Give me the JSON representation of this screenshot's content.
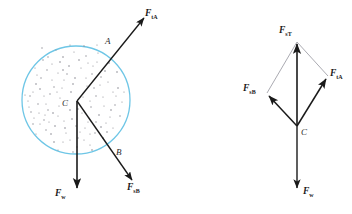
{
  "figure": {
    "colors": {
      "circle_stroke": "#6ec6e6",
      "arrow": "#1a1a1a",
      "thin_line": "#7b7b86",
      "speckle": "#8a8a92",
      "background": "#ffffff",
      "label_text": "#1a1a1a"
    },
    "left_diagram": {
      "name": "ball-free-body-diagram",
      "circle": {
        "cx": 76,
        "cy": 100,
        "r": 54
      },
      "center_point_label": "C",
      "contact_point_a_label": "A",
      "contact_point_b_label": "B",
      "forces": [
        {
          "id": "FtA",
          "symbol": "F",
          "subscript": "tA",
          "description": "contact force at point A directed up and to the right",
          "from": {
            "x": 77,
            "y": 101
          },
          "to": {
            "x": 146,
            "y": 16
          }
        },
        {
          "id": "FsB",
          "symbol": "F",
          "subscript": "sB",
          "description": "contact force at point B directed down and to the right",
          "from": {
            "x": 77,
            "y": 101
          },
          "to": {
            "x": 134,
            "y": 182
          }
        },
        {
          "id": "Fw",
          "symbol": "F",
          "subscript": "w",
          "description": "weight force directed straight down from the center",
          "from": {
            "x": 77,
            "y": 101
          },
          "to": {
            "x": 77,
            "y": 190
          }
        }
      ]
    },
    "right_diagram": {
      "name": "vector-addition-parallelogram",
      "origin_label": "C",
      "origin": {
        "x": 297,
        "y": 126
      },
      "forces": [
        {
          "id": "FsT",
          "symbol": "F",
          "subscript": "sT",
          "description": "resultant force directed straight up (sum of FsA and FsB)",
          "from": {
            "x": 297,
            "y": 126
          },
          "to": {
            "x": 297,
            "y": 42
          }
        },
        {
          "id": "FtA",
          "symbol": "F",
          "subscript": "tA",
          "description": "component vector directed up and to the right",
          "from": {
            "x": 297,
            "y": 126
          },
          "to": {
            "x": 328,
            "y": 76
          }
        },
        {
          "id": "FsB",
          "symbol": "F",
          "subscript": "sB",
          "description": "component vector directed up and to the left",
          "from": {
            "x": 297,
            "y": 126
          },
          "to": {
            "x": 267,
            "y": 93
          }
        },
        {
          "id": "Fw",
          "symbol": "F",
          "subscript": "w",
          "description": "weight force directed straight down from C",
          "from": {
            "x": 297,
            "y": 126
          },
          "to": {
            "x": 297,
            "y": 190
          }
        }
      ],
      "construction_lines": [
        {
          "from": {
            "x": 267,
            "y": 93
          },
          "to": {
            "x": 297,
            "y": 42
          }
        },
        {
          "from": {
            "x": 328,
            "y": 76
          },
          "to": {
            "x": 297,
            "y": 42
          }
        }
      ]
    }
  }
}
